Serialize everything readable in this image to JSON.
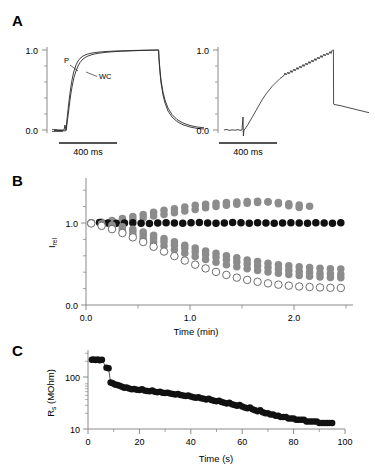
{
  "figure": {
    "panels": [
      {
        "letter": "A"
      },
      {
        "letter": "B"
      },
      {
        "letter": "C"
      }
    ]
  },
  "panelA": {
    "letter": "A",
    "left": {
      "y_ticks": [
        "1.0",
        "0.0"
      ],
      "ylim": [
        -0.08,
        1.12
      ],
      "scalebar_label": "400 ms",
      "trace_labels": [
        "P",
        "WC"
      ],
      "trace_label_p": "P",
      "trace_label_wc": "WC"
    },
    "right": {
      "y_ticks": [
        "1.0",
        "0.0"
      ],
      "ylim": [
        -0.08,
        1.12
      ],
      "scalebar_label": "400 ms"
    }
  },
  "panelB": {
    "letter": "B",
    "ylabel": "I",
    "ylabel_sub": "rel",
    "xlabel": "Time (min)",
    "y_ticks": [
      "1.0",
      "0.0"
    ],
    "x_ticks": [
      "0.0",
      "1.0",
      "2.0"
    ]
  },
  "panelC": {
    "letter": "C",
    "ylabel": "R",
    "ylabel_sub": "s",
    "ylabel_unit": " (MOhm)",
    "xlabel": "Time (s)",
    "y_ticks": [
      "100",
      "10"
    ],
    "x_ticks": [
      "0",
      "20",
      "40",
      "60",
      "80",
      "100"
    ]
  },
  "colors": {
    "axis": "#8a8a8a",
    "trace": "#2b2b2b",
    "black_marker": "#111111",
    "gray_marker": "#8c8c8c",
    "open_marker_fill": "#ffffff",
    "open_marker_stroke": "#6e6e6e",
    "text": "#000000"
  },
  "chart_data": [
    {
      "id": "A-left",
      "type": "line",
      "title": "",
      "xlabel": "",
      "ylabel": "",
      "xlim": [
        0,
        2400
      ],
      "ylim": [
        -0.08,
        1.12
      ],
      "x_unit": "ms",
      "grid": false,
      "legend": "inline-labels",
      "scalebar": {
        "label": "400 ms",
        "value": 400,
        "unit": "ms"
      },
      "y_tick_values": [
        0.0,
        1.0
      ],
      "y_minor_ticks": [
        0.2,
        0.4,
        0.6,
        0.8
      ],
      "series": [
        {
          "name": "P",
          "description": "perforated-patch activation, faster rise",
          "tau_rise_ms": 150,
          "tau_decay_ms": 170,
          "step_on_ms": 180,
          "step_off_ms": 1520,
          "plateau": 1.0,
          "x": [
            0,
            60,
            120,
            170,
            180,
            200,
            240,
            300,
            380,
            460,
            560,
            680,
            820,
            980,
            1160,
            1340,
            1520,
            1540,
            1600,
            1700,
            1840,
            2000,
            2200,
            2400
          ],
          "y": [
            0.0,
            0.0,
            0.0,
            0.0,
            0.02,
            0.17,
            0.41,
            0.63,
            0.78,
            0.86,
            0.91,
            0.945,
            0.965,
            0.98,
            0.99,
            0.998,
            1.0,
            0.56,
            0.34,
            0.19,
            0.11,
            0.07,
            0.045,
            0.035
          ]
        },
        {
          "name": "WC",
          "description": "whole-cell activation, slightly slower rise",
          "tau_rise_ms": 200,
          "tau_decay_ms": 215,
          "step_on_ms": 180,
          "step_off_ms": 1520,
          "plateau": 1.0,
          "x": [
            0,
            60,
            120,
            170,
            180,
            200,
            240,
            300,
            380,
            460,
            560,
            680,
            820,
            980,
            1160,
            1340,
            1520,
            1540,
            1600,
            1700,
            1840,
            2000,
            2200,
            2400
          ],
          "y": [
            0.0,
            0.0,
            0.0,
            0.0,
            0.01,
            0.11,
            0.31,
            0.53,
            0.7,
            0.81,
            0.88,
            0.925,
            0.955,
            0.975,
            0.988,
            0.996,
            1.0,
            0.62,
            0.4,
            0.24,
            0.145,
            0.09,
            0.055,
            0.04
          ]
        }
      ]
    },
    {
      "id": "A-right",
      "type": "line",
      "title": "",
      "xlabel": "",
      "ylabel": "",
      "xlim": [
        0,
        2400
      ],
      "ylim": [
        -0.08,
        1.12
      ],
      "x_unit": "ms",
      "grid": false,
      "noisy": true,
      "scalebar": {
        "label": "400 ms",
        "value": 400,
        "unit": "ms"
      },
      "y_tick_values": [
        0.0,
        1.0
      ],
      "y_minor_ticks": [
        0.2,
        0.4,
        0.6,
        0.8
      ],
      "series": [
        {
          "name": "trace",
          "description": "sigmoidal rise with noise, artifact spike at onset, step off to ~0.30 then slow decay",
          "step_on_ms": 340,
          "step_off_ms": 1700,
          "artifact_spike_ms": 340,
          "plateau": 1.0,
          "offset_after_step": 0.3,
          "x": [
            0,
            80,
            160,
            240,
            320,
            340,
            360,
            420,
            500,
            580,
            680,
            780,
            880,
            980,
            1100,
            1220,
            1340,
            1460,
            1580,
            1700,
            1710,
            1800,
            1950,
            2100,
            2250,
            2400
          ],
          "y": [
            0.0,
            0.0,
            0.005,
            0.0,
            0.0,
            0.0,
            0.02,
            0.1,
            0.23,
            0.35,
            0.5,
            0.63,
            0.73,
            0.8,
            0.855,
            0.9,
            0.93,
            0.955,
            0.98,
            1.0,
            0.3,
            0.285,
            0.26,
            0.235,
            0.215,
            0.2
          ]
        }
      ]
    },
    {
      "id": "B",
      "type": "scatter",
      "title": "",
      "xlabel": "Time (min)",
      "ylabel": "I_rel",
      "xlim": [
        -0.05,
        2.55
      ],
      "ylim": [
        0.0,
        1.32
      ],
      "grid": false,
      "x_tick_values": [
        0.0,
        1.0,
        2.0
      ],
      "x_minor_ticks": [
        0.5,
        1.5,
        2.5
      ],
      "y_tick_values": [
        0.0,
        1.0
      ],
      "y_minor_ticks": [
        0.2,
        0.4,
        0.6,
        0.8,
        1.2
      ],
      "marker_size_px": 7.5,
      "series": [
        {
          "name": "gray-rising",
          "style": "filled-gray",
          "color": "#8c8c8c",
          "x": [
            0.05,
            0.15,
            0.25,
            0.35,
            0.45,
            0.55,
            0.65,
            0.75,
            0.85,
            0.95,
            1.05,
            1.15,
            1.25,
            1.35,
            1.45,
            1.55,
            1.65,
            1.75,
            1.85,
            1.95,
            2.05
          ],
          "y": [
            1.0,
            1.01,
            1.03,
            1.055,
            1.08,
            1.105,
            1.13,
            1.155,
            1.175,
            1.195,
            1.215,
            1.23,
            1.24,
            1.25,
            1.255,
            1.262,
            1.265,
            1.255,
            1.235,
            1.21,
            1.19
          ]
        },
        {
          "name": "gray-rising-2",
          "style": "filled-gray",
          "color": "#8c8c8c",
          "x": [
            0.05,
            0.15,
            0.25,
            0.35,
            0.45,
            0.55,
            0.65,
            0.75,
            0.85,
            0.95,
            1.05,
            1.15,
            1.25,
            1.35,
            1.45,
            1.55,
            1.65,
            1.75,
            1.85,
            1.95,
            2.05,
            2.15
          ],
          "y": [
            1.0,
            1.005,
            1.015,
            1.03,
            1.045,
            1.065,
            1.085,
            1.105,
            1.125,
            1.145,
            1.165,
            1.185,
            1.2,
            1.215,
            1.228,
            1.24,
            1.25,
            1.258,
            1.25,
            1.235,
            1.218,
            1.205
          ]
        },
        {
          "name": "black-flat",
          "style": "filled-black",
          "color": "#111111",
          "x": [
            0.05,
            0.13,
            0.21,
            0.29,
            0.37,
            0.45,
            0.53,
            0.61,
            0.69,
            0.77,
            0.85,
            0.93,
            1.01,
            1.09,
            1.17,
            1.25,
            1.33,
            1.41,
            1.49,
            1.57,
            1.65,
            1.73,
            1.81,
            1.89,
            1.97,
            2.05,
            2.13,
            2.21,
            2.29,
            2.37,
            2.45
          ],
          "y": [
            1.0,
            1.005,
            1.0,
            0.998,
            1.0,
            1.003,
            0.998,
            0.995,
            1.0,
            1.004,
            1.0,
            0.997,
            1.002,
            1.006,
            1.0,
            0.996,
            1.0,
            1.005,
            1.002,
            0.998,
            1.003,
            1.0,
            0.996,
            1.0,
            1.004,
            1.0,
            0.997,
            1.002,
            1.0,
            0.998,
            1.003
          ]
        },
        {
          "name": "gray-decline-1",
          "style": "filled-gray",
          "color": "#8c8c8c",
          "x": [
            0.05,
            0.15,
            0.25,
            0.35,
            0.45,
            0.55,
            0.65,
            0.75,
            0.85,
            0.95,
            1.05,
            1.15,
            1.25,
            1.35,
            1.45,
            1.55,
            1.65,
            1.75,
            1.85,
            1.95,
            2.05,
            2.15,
            2.25,
            2.35,
            2.45
          ],
          "y": [
            1.0,
            0.99,
            0.975,
            0.955,
            0.925,
            0.89,
            0.85,
            0.81,
            0.77,
            0.73,
            0.695,
            0.66,
            0.63,
            0.6,
            0.575,
            0.55,
            0.53,
            0.51,
            0.492,
            0.478,
            0.466,
            0.456,
            0.448,
            0.442,
            0.438
          ]
        },
        {
          "name": "gray-decline-2",
          "style": "filled-gray",
          "color": "#8c8c8c",
          "x": [
            0.05,
            0.15,
            0.25,
            0.35,
            0.45,
            0.55,
            0.65,
            0.75,
            0.85,
            0.95,
            1.05,
            1.15,
            1.25,
            1.35,
            1.45,
            1.55,
            1.65,
            1.75,
            1.85,
            1.95,
            2.05,
            2.15,
            2.25,
            2.35,
            2.45
          ],
          "y": [
            1.0,
            0.985,
            0.962,
            0.932,
            0.895,
            0.855,
            0.812,
            0.77,
            0.728,
            0.688,
            0.65,
            0.615,
            0.582,
            0.552,
            0.525,
            0.5,
            0.478,
            0.458,
            0.44,
            0.424,
            0.41,
            0.398,
            0.388,
            0.38,
            0.374
          ]
        },
        {
          "name": "gray-decline-3",
          "style": "filled-gray",
          "color": "#8c8c8c",
          "x": [
            0.05,
            0.15,
            0.25,
            0.35,
            0.45,
            0.55,
            0.65,
            0.75,
            0.85,
            0.95,
            1.05,
            1.15,
            1.25,
            1.35,
            1.45,
            1.55,
            1.65,
            1.75,
            1.85,
            1.95,
            2.05,
            2.15,
            2.25,
            2.35,
            2.45
          ],
          "y": [
            0.995,
            0.975,
            0.945,
            0.905,
            0.86,
            0.812,
            0.765,
            0.72,
            0.675,
            0.632,
            0.592,
            0.556,
            0.522,
            0.492,
            0.465,
            0.441,
            0.42,
            0.402,
            0.386,
            0.372,
            0.36,
            0.35,
            0.342,
            0.336,
            0.332
          ]
        },
        {
          "name": "open-decline",
          "style": "open",
          "color": "#ffffff",
          "stroke": "#6e6e6e",
          "x": [
            0.05,
            0.15,
            0.25,
            0.35,
            0.45,
            0.55,
            0.65,
            0.75,
            0.85,
            0.95,
            1.05,
            1.15,
            1.25,
            1.35,
            1.45,
            1.55,
            1.65,
            1.75,
            1.85,
            1.95,
            2.05,
            2.15,
            2.25,
            2.35,
            2.45
          ],
          "y": [
            0.995,
            0.965,
            0.925,
            0.878,
            0.825,
            0.768,
            0.71,
            0.652,
            0.596,
            0.542,
            0.492,
            0.446,
            0.404,
            0.367,
            0.334,
            0.306,
            0.283,
            0.264,
            0.248,
            0.236,
            0.226,
            0.219,
            0.214,
            0.21,
            0.208
          ]
        }
      ]
    },
    {
      "id": "C",
      "type": "scatter",
      "title": "",
      "xlabel": "Time (s)",
      "ylabel": "R_s (MOhm)",
      "xlim": [
        0,
        100
      ],
      "ylim": [
        10,
        300
      ],
      "yscale": "log",
      "grid": false,
      "x_tick_values": [
        0,
        20,
        40,
        60,
        80,
        100
      ],
      "x_minor_ticks": [
        10,
        30,
        50,
        70,
        90
      ],
      "y_tick_values": [
        10,
        100
      ],
      "marker_size_px": 6.5,
      "series": [
        {
          "name": "Rs-decay",
          "style": "filled-black",
          "color": "#111111",
          "x": [
            1.5,
            2.2,
            3.0,
            3.8,
            4.6,
            5.4,
            7.2,
            8.0,
            8.8,
            9.6,
            10.5,
            11.4,
            12.3,
            13.2,
            14.1,
            15.0,
            16.0,
            17.0,
            18.0,
            19.0,
            20.0,
            21.0,
            22.0,
            23.0,
            24.0,
            25.0,
            26.0,
            27.0,
            28.0,
            29.0,
            30.0,
            31.0,
            32.0,
            33.0,
            34.0,
            35.0,
            36.0,
            37.0,
            38.0,
            39.0,
            40.0,
            41.0,
            42.0,
            43.0,
            44.0,
            45.0,
            46.0,
            47.0,
            48.0,
            49.0,
            50.0,
            51.0,
            52.0,
            53.0,
            54.0,
            55.0,
            56.0,
            57.0,
            58.0,
            59.0,
            60.0,
            61.0,
            62.0,
            63.0,
            64.0,
            65.0,
            66.0,
            67.0,
            68.0,
            69.0,
            70.0,
            71.0,
            72.0,
            73.0,
            74.0,
            75.0,
            76.0,
            77.0,
            78.0,
            79.0,
            80.0,
            81.0,
            82.0,
            83.0,
            84.0,
            85.0,
            86.0,
            87.0,
            88.0,
            89.0,
            90.0,
            91.0,
            92.0,
            93.0,
            94.0,
            95.0
          ],
          "y": [
            215,
            218,
            212,
            216,
            210,
            214,
            150,
            148,
            78,
            76,
            72,
            70,
            68,
            65,
            62,
            63,
            60,
            58,
            59,
            57,
            56,
            58,
            55,
            54,
            53,
            55,
            52,
            51,
            52,
            50,
            49,
            50,
            48,
            47,
            46,
            47,
            45,
            44,
            43,
            44,
            42,
            41,
            40,
            41,
            39,
            38,
            37,
            38,
            36,
            35,
            34,
            35,
            33,
            32,
            31,
            32,
            30,
            29,
            28,
            29,
            27,
            26,
            25,
            26,
            24,
            23,
            22,
            23,
            21,
            20,
            20,
            19,
            19,
            18,
            18,
            17,
            17,
            17,
            16,
            16,
            16,
            15,
            15,
            15,
            15,
            14,
            14,
            14,
            14,
            14,
            13,
            13,
            13,
            13,
            13,
            13
          ]
        }
      ]
    }
  ]
}
